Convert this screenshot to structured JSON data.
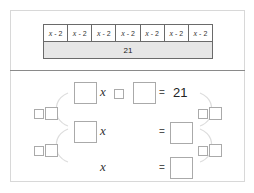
{
  "bar_model": {
    "segments": [
      {
        "var": "x",
        "text": "- 2"
      },
      {
        "var": "x",
        "text": "- 2"
      },
      {
        "var": "x",
        "text": "- 2"
      },
      {
        "var": "x",
        "text": "- 2"
      },
      {
        "var": "x",
        "text": "- 2"
      },
      {
        "var": "x",
        "text": "- 2"
      },
      {
        "var": "x",
        "text": "- 2"
      }
    ],
    "total": "21"
  },
  "equations": {
    "row1": {
      "var": "x",
      "equals": "=",
      "rhs": "21"
    },
    "row2": {
      "var": "x",
      "equals": "="
    },
    "row3": {
      "var": "x",
      "equals": "="
    }
  },
  "colors": {
    "border": "#6a6a6a",
    "total_fill": "#e6e6e6",
    "box_border": "#aaaaaa",
    "arc": "#dddddd"
  }
}
